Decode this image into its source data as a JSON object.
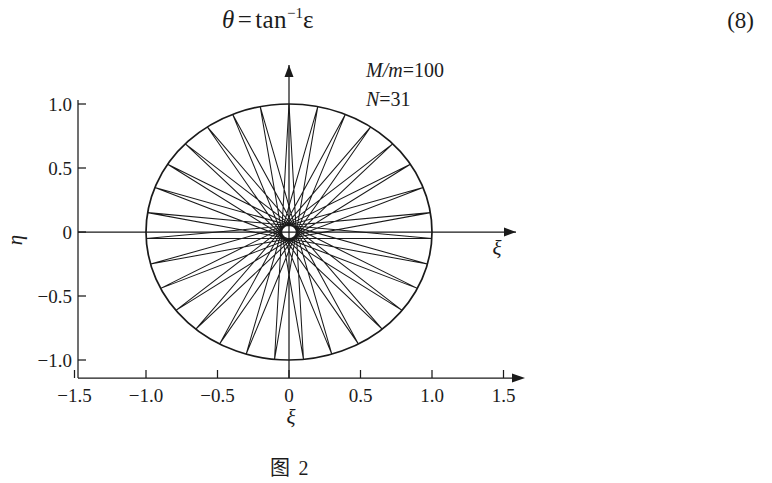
{
  "equation": {
    "lhs": "θ",
    "relation": "=",
    "function": "tan",
    "exponent": "−1",
    "argument": "ε",
    "number": "(8)"
  },
  "figure": {
    "caption": "图 2",
    "annotations": {
      "mass_ratio_label": "M/m",
      "mass_ratio_eq": "=100",
      "count_label": "N",
      "count_eq": "=31"
    },
    "axes": {
      "x_axis_name": "ξ",
      "y_axis_name": "η",
      "x_ticks": [
        "-1.5",
        "-1.0",
        "-0.5",
        "0",
        "0.5",
        "1.0",
        "1.5"
      ],
      "y_ticks": [
        "1.0",
        "0.5",
        "0",
        "-0.5",
        "-1.0"
      ],
      "x_tick_values": [
        -1.5,
        -1.0,
        -0.5,
        0,
        0.5,
        1.0,
        1.5
      ],
      "y_tick_values": [
        1.0,
        0.5,
        0,
        -0.5,
        -1.0
      ],
      "xlim": [
        -1.65,
        1.72
      ],
      "ylim": [
        -1.2,
        1.25
      ]
    },
    "line_color": "#1a1a1a"
  },
  "chart_data": {
    "type": "line",
    "title": "图 2",
    "xlabel": "ξ",
    "ylabel": "η",
    "xlim": [
      -1.65,
      1.72
    ],
    "ylim": [
      -1.2,
      1.25
    ],
    "grid": false,
    "legend": "none",
    "annotations": [
      "M/m=100",
      "N=31"
    ],
    "series": [
      {
        "name": "unit-circle",
        "kind": "circle",
        "center": [
          0,
          0
        ],
        "radius": 1.0
      },
      {
        "name": "star-polygon-chords",
        "kind": "star-polygon",
        "vertices_on_circle": 31,
        "step": 15,
        "radius": 1.0,
        "description": "Closed zig-zag path visiting 31 equally spaced points on the unit circle, each chord skipping 15 points, producing a dense near-vertical lattice."
      }
    ],
    "x_ticks": [
      -1.5,
      -1.0,
      -0.5,
      0,
      0.5,
      1.0,
      1.5
    ],
    "y_ticks": [
      1.0,
      0.5,
      0,
      -0.5,
      -1.0
    ]
  }
}
